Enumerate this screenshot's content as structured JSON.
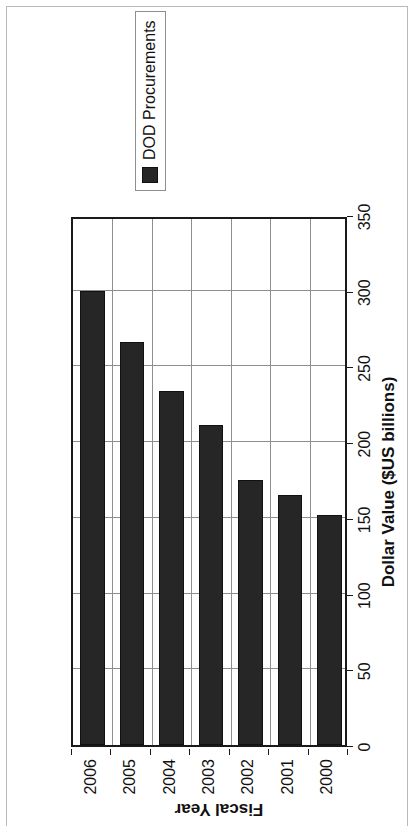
{
  "chart_data": {
    "type": "bar",
    "orientation": "horizontal",
    "title": "",
    "subtitle": "",
    "categories": [
      "2000",
      "2001",
      "2002",
      "2003",
      "2004",
      "2005",
      "2006"
    ],
    "series": [
      {
        "name": "DOD Procurements",
        "color": "#262626",
        "values": [
          152,
          165,
          175,
          211,
          234,
          266,
          300
        ]
      }
    ],
    "xlabel": "Dollar Value ($US billions)",
    "ylabel": "Fiscal Year",
    "value_axis_label": "Dollar Value ($US billions)",
    "category_axis_label": "Fiscal Year",
    "value_ticks": [
      0,
      50,
      100,
      150,
      200,
      250,
      300,
      350
    ],
    "value_tick_labels": [
      "0",
      "50",
      "100",
      "150",
      "200",
      "250",
      "300",
      "350"
    ],
    "xlim": [
      0,
      350
    ],
    "grid": "value-axis gridlines only",
    "legend": {
      "position": "right",
      "entries": [
        {
          "label": "DOD Procurements",
          "swatch_color": "#262626"
        }
      ]
    },
    "page_rotation_degrees": -90,
    "colors": {
      "bar": "#262626",
      "gridline": "#8e8e8e",
      "axis": "#1a1a1a",
      "page_border": "#b9b9b9",
      "background": "#ffffff",
      "text": "#111111"
    }
  },
  "legend": {
    "entry_label": "DOD Procurements"
  },
  "axes": {
    "value_title": "Dollar Value ($US billions)",
    "category_title": "Fiscal Year"
  }
}
